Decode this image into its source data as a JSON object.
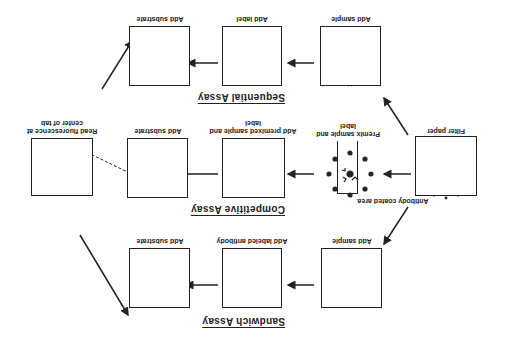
{
  "figure": {
    "orientation": "rotated 180 degrees",
    "start": {
      "box_label": "Filter paper",
      "annotation": "Antibody coated area"
    },
    "assays": [
      {
        "title": "Sequential Assay",
        "steps": [
          {
            "label": "Add sample"
          },
          {
            "label": "Add label"
          },
          {
            "label": "Add substrate"
          }
        ]
      },
      {
        "title": "Competitive Assay",
        "steps": [
          {
            "label": "Premix sample and label"
          },
          {
            "label": "Add premixed sample and label"
          },
          {
            "label": "Add substrate"
          }
        ]
      },
      {
        "title": "Sandwich Assay",
        "steps": [
          {
            "label": "Add sample"
          },
          {
            "label": "Add labeled antibody"
          },
          {
            "label": "Add substrate"
          }
        ]
      }
    ],
    "end": {
      "label": "Read fluorescence at center of tab"
    }
  }
}
